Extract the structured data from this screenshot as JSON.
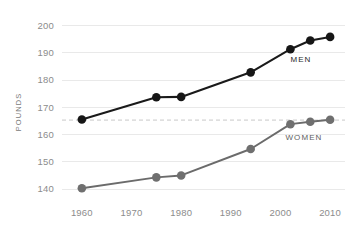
{
  "chart_data": {
    "type": "line",
    "title": "",
    "subtitle": "",
    "xlabel": "",
    "ylabel": "POUNDS",
    "xlim": [
      1956,
      2013
    ],
    "ylim": [
      136,
      202
    ],
    "grid": true,
    "legend_position": "inline-annotation",
    "x_ticks": [
      1960,
      1970,
      1980,
      1990,
      2000,
      2010
    ],
    "x_tick_labels": [
      "1960",
      "1970",
      "1980",
      "1990",
      "2000",
      "2010"
    ],
    "y_ticks": [
      140,
      150,
      160,
      170,
      180,
      190,
      200
    ],
    "y_tick_labels": [
      "140",
      "150",
      "160",
      "170",
      "180",
      "190",
      "200"
    ],
    "annotations": [
      {
        "text": "MEN",
        "x": 2002,
        "y": 186.5,
        "color": "#2a2a2a"
      },
      {
        "text": "WOMEN",
        "x": 2001,
        "y": 158.0,
        "color": "#5e5e5e"
      }
    ],
    "reference_lines": [
      {
        "orientation": "horizontal",
        "y": 165.3,
        "style": "dashed",
        "color": "#c9c9c9"
      }
    ],
    "series": [
      {
        "name": "MEN",
        "color": "#1a1a1a",
        "marker": "circle",
        "x": [
          1960,
          1975,
          1980,
          1994,
          2002,
          2006,
          2010
        ],
        "values": [
          165.5,
          173.7,
          173.8,
          182.8,
          191.3,
          194.5,
          195.8
        ]
      },
      {
        "name": "WOMEN",
        "color": "#6b6b6b",
        "marker": "circle",
        "x": [
          1960,
          1975,
          1980,
          1994,
          2002,
          2006,
          2010
        ],
        "values": [
          140.3,
          144.3,
          145.0,
          154.7,
          163.8,
          164.7,
          165.4
        ]
      }
    ]
  },
  "colors": {
    "background": "#ffffff",
    "grid": "#e9e9e9",
    "reference_line": "#c9c9c9",
    "tick_text": "#8c8c8c",
    "axis_title": "#7a7a7a",
    "men": "#1a1a1a",
    "women": "#6b6b6b"
  }
}
